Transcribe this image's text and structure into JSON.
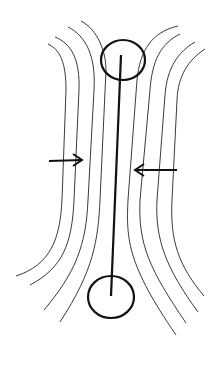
{
  "diagram": {
    "colors": {
      "background": "#ffffff",
      "lines": "#3a3a3a",
      "rod": "#111111"
    },
    "elements": {
      "rod": "central-rod",
      "top_circle": "top-circle",
      "bottom_circle": "bottom-circle",
      "left_arrow": "arrow-pointing-right",
      "right_arrow": "arrow-pointing-left",
      "field_lines_left": 4,
      "field_lines_right": 4
    }
  }
}
